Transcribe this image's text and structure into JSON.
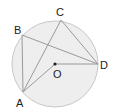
{
  "diagram": {
    "type": "circle-geometry",
    "colors": {
      "circle_fill": "#eeeeee",
      "circle_stroke": "#c8c8c8",
      "line": "#9a9a9a",
      "label": "#222222",
      "center_dot": "#222222"
    },
    "circle": {
      "cx": 55,
      "cy": 64,
      "r": 43
    },
    "points": {
      "A": {
        "label": "A",
        "x": 23,
        "y": 92
      },
      "B": {
        "label": "B",
        "x": 22,
        "y": 35
      },
      "C": {
        "label": "C",
        "x": 61,
        "y": 20
      },
      "D": {
        "label": "D",
        "x": 98,
        "y": 64
      },
      "O": {
        "label": "O",
        "x": 55,
        "y": 64
      }
    },
    "segments": [
      [
        "A",
        "B"
      ],
      [
        "B",
        "D"
      ],
      [
        "A",
        "C"
      ],
      [
        "C",
        "D"
      ],
      [
        "A",
        "O"
      ],
      [
        "O",
        "D"
      ]
    ]
  }
}
